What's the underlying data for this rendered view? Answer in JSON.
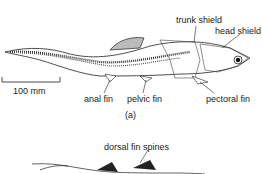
{
  "figure": {
    "panel_a": {
      "caption": "(a)",
      "labels": {
        "trunk_shield": "trunk shield",
        "head_shield": "head shield",
        "anal_fin": "anal fin",
        "pelvic_fin": "pelvic fin",
        "pectoral_fin": "pectoral fin"
      },
      "scale_bar": "100 mm"
    },
    "panel_b": {
      "labels": {
        "dorsal_fin_spines": "dorsal fin spines"
      }
    }
  }
}
